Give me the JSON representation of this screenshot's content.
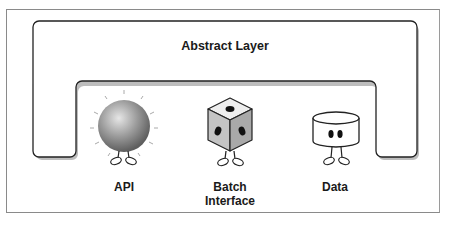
{
  "diagram": {
    "title": "Abstract Layer",
    "components": [
      {
        "label": "API",
        "icon": "sphere-character-icon"
      },
      {
        "label_line1": "Batch",
        "label_line2": "Interface",
        "icon": "dice-character-icon"
      },
      {
        "label": "Data",
        "icon": "cylinder-character-icon"
      }
    ]
  },
  "colors": {
    "stroke": "#222222",
    "shadow": "#b5b5b5",
    "frame": "#8a8a8a",
    "sphere": "#8f8f8f",
    "dice_side": "#b8b8b8"
  }
}
